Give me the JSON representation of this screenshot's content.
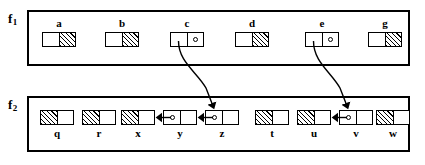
{
  "diagram": {
    "frames": [
      {
        "id": "f1",
        "label": "f",
        "subscript": "1",
        "box": {
          "x": 27,
          "y": 10,
          "w": 383,
          "h": 56
        },
        "label_pos": {
          "x": 8,
          "y": 12
        },
        "cells": [
          {
            "name": "a",
            "x": 42,
            "y": 32,
            "left": "plain",
            "right": "hatch"
          },
          {
            "name": "b",
            "x": 105,
            "y": 32,
            "left": "plain",
            "right": "hatch"
          },
          {
            "name": "c",
            "x": 170,
            "y": 32,
            "left": "plain",
            "right": "pointer"
          },
          {
            "name": "d",
            "x": 235,
            "y": 32,
            "left": "plain",
            "right": "hatch"
          },
          {
            "name": "e",
            "x": 305,
            "y": 32,
            "left": "plain",
            "right": "pointer"
          },
          {
            "name": "g",
            "x": 368,
            "y": 32,
            "left": "plain",
            "right": "hatch"
          }
        ]
      },
      {
        "id": "f2",
        "label": "f",
        "subscript": "2",
        "box": {
          "x": 27,
          "y": 96,
          "w": 383,
          "h": 56
        },
        "label_pos": {
          "x": 8,
          "y": 98
        },
        "cells": [
          {
            "name": "q",
            "x": 40,
            "y": 110,
            "left": "hatch",
            "right": "plain"
          },
          {
            "name": "r",
            "x": 82,
            "y": 110,
            "left": "hatch",
            "right": "plain"
          },
          {
            "name": "x",
            "x": 121,
            "y": 110,
            "left": "hatch",
            "right": "plain"
          },
          {
            "name": "y",
            "x": 163,
            "y": 110,
            "left": "pointer",
            "right": "plain"
          },
          {
            "name": "z",
            "x": 205,
            "y": 110,
            "left": "pointer",
            "right": "plain"
          },
          {
            "name": "t",
            "x": 255,
            "y": 110,
            "left": "hatch",
            "right": "plain"
          },
          {
            "name": "u",
            "x": 297,
            "y": 110,
            "left": "hatch",
            "right": "plain"
          },
          {
            "name": "v",
            "x": 339,
            "y": 110,
            "left": "pointer",
            "right": "plain"
          },
          {
            "name": "w",
            "x": 376,
            "y": 110,
            "left": "hatch",
            "right": "plain"
          }
        ]
      }
    ],
    "links": [
      {
        "id": "c-to-z",
        "from": "c",
        "to": "z",
        "kind": "curved-cross-frame"
      },
      {
        "id": "e-to-v",
        "from": "e",
        "to": "v",
        "kind": "curved-cross-frame"
      },
      {
        "id": "y-to-x",
        "from": "y",
        "to": "x",
        "kind": "straight-left"
      },
      {
        "id": "z-to-y",
        "from": "z",
        "to": "y",
        "kind": "straight-left"
      },
      {
        "id": "v-to-u",
        "from": "v",
        "to": "u",
        "kind": "straight-left"
      }
    ],
    "colors": {
      "stroke": "#000000",
      "background": "#ffffff",
      "hatch": "#000000"
    }
  }
}
